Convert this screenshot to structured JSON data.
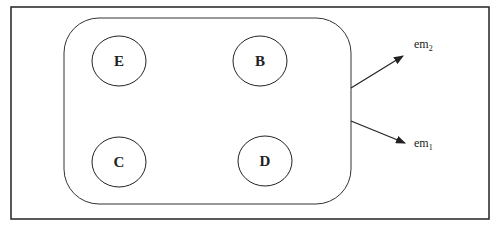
{
  "diagram": {
    "nodes": [
      {
        "id": "E",
        "label": "E"
      },
      {
        "id": "B",
        "label": "B"
      },
      {
        "id": "C",
        "label": "C"
      },
      {
        "id": "D",
        "label": "D"
      }
    ],
    "outputs": [
      {
        "id": "em2",
        "base": "em",
        "sub": "2"
      },
      {
        "id": "em1",
        "base": "em",
        "sub": "1"
      }
    ],
    "colors": {
      "stroke": "#222222",
      "background": "#ffffff"
    }
  }
}
